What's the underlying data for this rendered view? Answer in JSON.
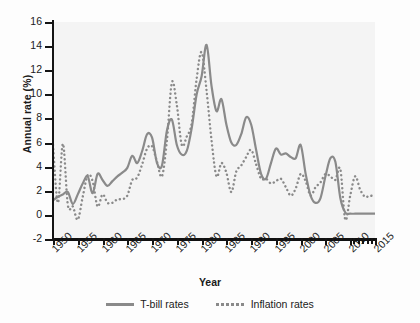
{
  "chart_data": {
    "type": "line",
    "title": "",
    "xlabel": "Year",
    "ylabel": "Annual rate (%)",
    "xlim": [
      1950,
      2015
    ],
    "ylim": [
      -2,
      16
    ],
    "yticks": [
      -2,
      0,
      2,
      4,
      6,
      8,
      10,
      12,
      14,
      16
    ],
    "xticks": [
      1950,
      1955,
      1960,
      1965,
      1970,
      1975,
      1980,
      1985,
      1990,
      1995,
      2000,
      2005,
      2010,
      2015
    ],
    "xtick_labels": [
      "1950",
      "1955",
      "1960",
      "1965",
      "1970",
      "1975",
      "1980",
      "1985",
      "1990",
      "1995",
      "2000",
      "2005",
      "2010",
      "2015"
    ],
    "grid": false,
    "legend_position": "bottom",
    "colors": {
      "line": "#8a8a8a",
      "axis": "#141414",
      "plot_background": "#f4f4f4"
    },
    "x": [
      1950,
      1951,
      1952,
      1953,
      1954,
      1955,
      1956,
      1957,
      1958,
      1959,
      1960,
      1961,
      1962,
      1963,
      1964,
      1965,
      1966,
      1967,
      1968,
      1969,
      1970,
      1971,
      1972,
      1973,
      1974,
      1975,
      1976,
      1977,
      1978,
      1979,
      1980,
      1981,
      1982,
      1983,
      1984,
      1985,
      1986,
      1987,
      1988,
      1989,
      1990,
      1991,
      1992,
      1993,
      1994,
      1995,
      1996,
      1997,
      1998,
      1999,
      2000,
      2001,
      2002,
      2003,
      2004,
      2005,
      2006,
      2007,
      2008,
      2009,
      2010,
      2011,
      2012,
      2013,
      2014,
      2015
    ],
    "series": [
      {
        "name": "T-bill rates",
        "style": "solid",
        "color": "#8a8a8a",
        "values": [
          1.2,
          1.5,
          1.7,
          1.9,
          0.9,
          1.7,
          2.6,
          3.2,
          1.8,
          3.4,
          2.9,
          2.4,
          2.8,
          3.2,
          3.5,
          3.9,
          4.9,
          4.3,
          5.3,
          6.7,
          6.4,
          4.3,
          4.1,
          7.0,
          7.9,
          5.8,
          5.0,
          5.3,
          7.2,
          10.0,
          11.5,
          14.1,
          10.7,
          8.6,
          9.6,
          7.5,
          6.0,
          5.8,
          6.7,
          8.1,
          7.5,
          5.4,
          3.4,
          3.0,
          4.3,
          5.5,
          5.0,
          5.1,
          4.8,
          4.7,
          5.8,
          3.4,
          1.6,
          1.0,
          1.4,
          3.2,
          4.7,
          4.4,
          1.4,
          0.2,
          0.1,
          0.1,
          0.1,
          0.1,
          0.1,
          0.1
        ]
      },
      {
        "name": "Inflation rates",
        "style": "dotted",
        "color": "#8a8a8a",
        "values": [
          5.8,
          1.0,
          5.9,
          0.8,
          0.7,
          -0.4,
          1.5,
          3.3,
          2.8,
          0.7,
          1.7,
          1.0,
          1.0,
          1.3,
          1.3,
          1.6,
          2.9,
          3.1,
          4.2,
          5.5,
          5.7,
          4.4,
          3.2,
          6.2,
          11.0,
          9.1,
          5.8,
          6.5,
          7.6,
          11.3,
          13.5,
          10.3,
          6.2,
          3.2,
          4.3,
          3.5,
          1.9,
          3.6,
          4.1,
          4.8,
          5.4,
          4.2,
          3.0,
          3.0,
          2.6,
          2.8,
          3.0,
          2.3,
          1.6,
          2.2,
          3.4,
          2.8,
          1.6,
          2.3,
          2.7,
          3.4,
          3.2,
          2.9,
          3.8,
          -0.4,
          1.6,
          3.2,
          2.1,
          1.5,
          1.6,
          1.5
        ]
      }
    ]
  },
  "legend": {
    "items": [
      {
        "label": "T-bill rates",
        "style": "solid"
      },
      {
        "label": "Inflation rates",
        "style": "dotted"
      }
    ]
  }
}
